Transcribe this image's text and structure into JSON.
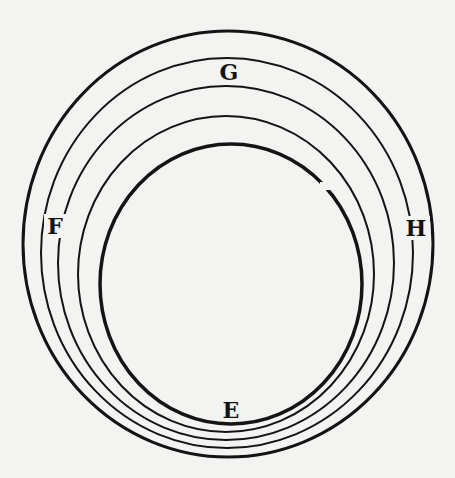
{
  "figure": {
    "type": "concentric-ellipses-diagram",
    "background": "#f3f3f1",
    "stroke_color": "#141414",
    "labels": [
      {
        "id": "G",
        "text": "G",
        "x": 229,
        "y": 80
      },
      {
        "id": "F",
        "text": "F",
        "x": 55,
        "y": 232
      },
      {
        "id": "H",
        "text": "H",
        "x": 416,
        "y": 234
      },
      {
        "id": "E",
        "text": "E",
        "x": 231,
        "y": 418
      }
    ],
    "rings": [
      {
        "name": "outer-ring",
        "cx": 228,
        "cy": 244,
        "rx": 205,
        "ry": 213,
        "width": 3
      },
      {
        "name": "ring-2",
        "cx": 227,
        "cy": 253,
        "rx": 186,
        "ry": 195,
        "width": 2
      },
      {
        "name": "ring-3",
        "cx": 226,
        "cy": 263,
        "rx": 168,
        "ry": 177,
        "width": 2
      },
      {
        "name": "ring-4",
        "cx": 226,
        "cy": 274,
        "rx": 148,
        "ry": 158,
        "width": 2
      },
      {
        "name": "inner-ring",
        "cx": 231,
        "cy": 284,
        "rx": 131,
        "ry": 140,
        "width": 3.5
      }
    ]
  }
}
